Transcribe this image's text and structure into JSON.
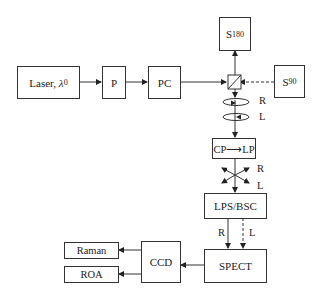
{
  "diagram": {
    "type": "optical setup flowchart",
    "nodes": {
      "laser": {
        "label": "Laser, ",
        "symbol": "λ",
        "subscript": "0"
      },
      "polarizer": {
        "label": "P"
      },
      "pc": {
        "label": "PC"
      },
      "s180": {
        "label": "S",
        "subscript": "180"
      },
      "s90": {
        "label": "S",
        "subscript": "90"
      },
      "cp_lp": {
        "label": "CP⟶LP"
      },
      "lps_bsc": {
        "label": "LPS/BSC"
      },
      "spect": {
        "label": "SPECT"
      },
      "ccd": {
        "label": "CCD"
      },
      "raman": {
        "label": "Raman"
      },
      "roa": {
        "label": "ROA"
      }
    },
    "labels": {
      "circ_r": "R",
      "circ_l": "L",
      "lin_r": "R",
      "lin_l": "L",
      "beam_r": "R",
      "beam_l": "L"
    },
    "edges": [
      {
        "from": "laser",
        "to": "polarizer",
        "style": "solid"
      },
      {
        "from": "polarizer",
        "to": "pc",
        "style": "solid"
      },
      {
        "from": "pc",
        "to": "prism",
        "style": "solid"
      },
      {
        "from": "prism",
        "to": "s180",
        "style": "solid"
      },
      {
        "from": "s90",
        "to": "prism",
        "style": "dashed"
      },
      {
        "from": "prism",
        "to": "cp_lp",
        "style": "solid"
      },
      {
        "from": "cp_lp",
        "to": "lps_bsc",
        "style": "solid"
      },
      {
        "from": "lps_bsc",
        "to": "spect",
        "style": "solid",
        "label": "R"
      },
      {
        "from": "lps_bsc",
        "to": "spect",
        "style": "dashed",
        "label": "L"
      },
      {
        "from": "spect",
        "to": "ccd",
        "style": "solid"
      },
      {
        "from": "ccd",
        "to": "raman",
        "style": "solid"
      },
      {
        "from": "ccd",
        "to": "roa",
        "style": "solid"
      }
    ]
  }
}
